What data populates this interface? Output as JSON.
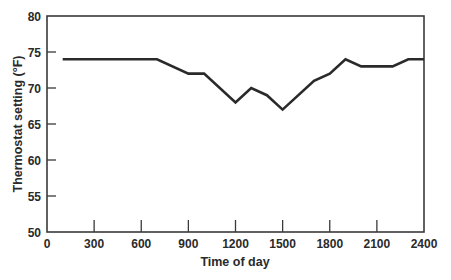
{
  "chart_data": {
    "type": "line",
    "title": "",
    "xlabel": "Time of day",
    "ylabel": "Thermostat setting (°F)",
    "xlim": [
      0,
      2400
    ],
    "ylim": [
      50,
      80
    ],
    "grid": false,
    "legend": null,
    "x_ticks": [
      0,
      300,
      600,
      900,
      1200,
      1500,
      1800,
      2100,
      2400
    ],
    "y_ticks": [
      50,
      55,
      60,
      65,
      70,
      75,
      80
    ],
    "series": [
      {
        "name": "Thermostat setting",
        "color": "#2a2a2a",
        "x": [
          100,
          700,
          900,
          1000,
          1200,
          1300,
          1400,
          1500,
          1700,
          1800,
          1900,
          2000,
          2200,
          2300,
          2400
        ],
        "values": [
          74,
          74,
          72,
          72,
          68,
          70,
          69,
          67,
          71,
          72,
          74,
          73,
          73,
          74,
          74
        ]
      }
    ]
  }
}
